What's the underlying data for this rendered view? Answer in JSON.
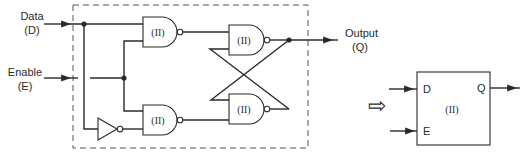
{
  "diagram": {
    "inputs": {
      "data": {
        "line1": "Data",
        "line2": "(D)"
      },
      "enable": {
        "line1": "Enable",
        "line2": "(E)"
      }
    },
    "output": {
      "line1": "Output",
      "line2": "(Q)"
    },
    "gates": [
      {
        "id": "nand-top-left",
        "type": "NAND",
        "label": "(II)"
      },
      {
        "id": "nand-bottom-left",
        "type": "NAND",
        "label": "(II)"
      },
      {
        "id": "nand-top-right",
        "type": "NAND",
        "label": "(II)"
      },
      {
        "id": "nand-bottom-right",
        "type": "NAND",
        "label": "(II)"
      },
      {
        "id": "inverter",
        "type": "NOT",
        "label": ""
      }
    ],
    "equivalence_arrow": "⇨",
    "block_symbol": {
      "label": "(II)",
      "pin_d": "D",
      "pin_e": "E",
      "pin_q": "Q"
    }
  }
}
